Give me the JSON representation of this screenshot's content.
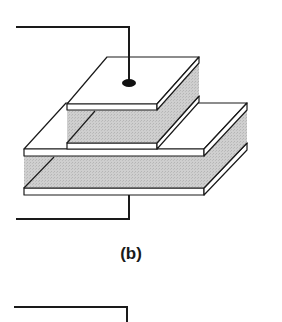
{
  "figure": {
    "caption": "(b)",
    "colors": {
      "plate_fill": "#ffffff",
      "dielectric_fill": "#c9c9c9",
      "line": "#1a1a1a",
      "background": "#ffffff"
    },
    "components": [
      {
        "id": "top-plate",
        "label": "top electrode plate"
      },
      {
        "id": "upper-dielectric",
        "label": "upper dielectric layer"
      },
      {
        "id": "middle-small-plate",
        "label": "middle small plate"
      },
      {
        "id": "large-plate",
        "label": "large middle plate"
      },
      {
        "id": "lower-dielectric",
        "label": "lower dielectric layer"
      },
      {
        "id": "bottom-plate",
        "label": "bottom electrode plate"
      },
      {
        "id": "top-lead",
        "label": "top lead wire with contact dot"
      },
      {
        "id": "bottom-lead",
        "label": "bottom lead wire"
      },
      {
        "id": "next-figure-lead",
        "label": "partial lead wire of next figure"
      }
    ]
  }
}
